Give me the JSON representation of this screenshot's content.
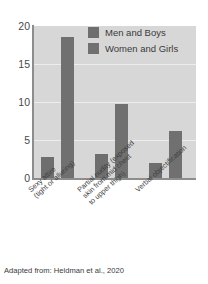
{
  "chart_data": {
    "type": "bar",
    "title": "",
    "xlabel": "",
    "ylabel": "",
    "ylim": [
      0,
      20
    ],
    "yticks": [
      0,
      5,
      10,
      15,
      20
    ],
    "ytick_labels": [
      "0",
      "5",
      "10",
      "15",
      "20"
    ],
    "grid": true,
    "legend_position": "top-right",
    "categories": [
      "Sexy attire\n(tight or alluring)",
      "Partial nudity (exposed\nskin from mid chest\nto upper thigh)",
      "Verbal objectification"
    ],
    "category_lines": [
      [
        "Sexy attire",
        "(tight or alluring)"
      ],
      [
        "Partial nudity (exposed",
        "skin from mid chest",
        "to upper thigh)"
      ],
      [
        "Verbal objectification"
      ]
    ],
    "series": [
      {
        "name": "Men and Boys",
        "color": "#6e6e6e",
        "values": [
          2.7,
          3.2,
          2.0
        ]
      },
      {
        "name": "Women and Girls",
        "color": "#707070",
        "values": [
          18.6,
          9.8,
          6.2
        ]
      }
    ],
    "caption": "Adapted from: Heldman et al., 2020",
    "plot_background": "#d7d7d7",
    "gridline_color": "#ededed",
    "axis_color": "#8d8d8d"
  }
}
